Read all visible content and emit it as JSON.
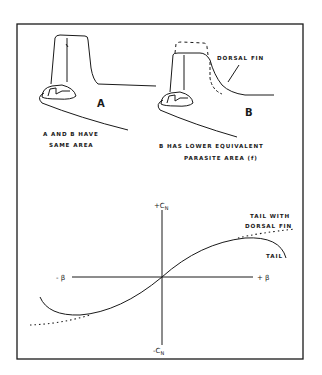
{
  "figure": {
    "colors": {
      "ink": "#1a1a1a",
      "background": "#ffffff"
    },
    "top_panel": {
      "drawing_a": {
        "letter": "A",
        "caption_line1": "A AND B HAVE",
        "caption_line2": "SAME AREA"
      },
      "drawing_b": {
        "letter": "B",
        "callout": "DORSAL FIN",
        "caption_line1": "B HAS LOWER EQUIVALENT",
        "caption_line2": "PARASITE AREA (f)"
      }
    },
    "graph": {
      "y_pos_label": "+C",
      "y_pos_sub": "N",
      "y_neg_label": "-C",
      "y_neg_sub": "N",
      "x_neg_label": "- β",
      "x_pos_label": "+ β",
      "curves": [
        {
          "name": "TAIL",
          "style": "solid"
        },
        {
          "name": "TAIL WITH DORSAL FIN",
          "style": "dotted"
        }
      ],
      "legend_tail_dorsal_line1": "TAIL WITH",
      "legend_tail_dorsal_line2": "DORSAL FIN",
      "legend_tail": "TAIL"
    }
  }
}
